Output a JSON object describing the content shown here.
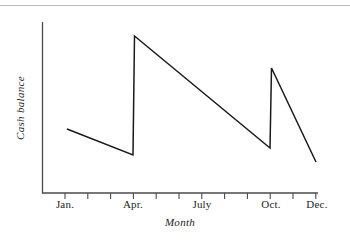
{
  "page": {
    "background_color": "#ffffff",
    "rule_color": "#b9b9b9"
  },
  "chart_data": {
    "type": "line",
    "title": "",
    "subtitle": "",
    "xlabel": "Month",
    "ylabel": "Cash balance",
    "grid": false,
    "legend": "none",
    "line_color": "#1a1a1a",
    "axis_color": "#4a4a4a",
    "xlim": [
      0,
      12
    ],
    "ylim": [
      0,
      10
    ],
    "x_tick_labels": [
      "Jan.",
      "",
      "",
      "Apr.",
      "",
      "",
      "July",
      "",
      "",
      "Oct.",
      "",
      "Dec."
    ],
    "x_tick_count": 12,
    "labelled_ticks": [
      {
        "index": 0,
        "label": "Jan."
      },
      {
        "index": 3,
        "label": "Apr."
      },
      {
        "index": 6,
        "label": "July"
      },
      {
        "index": 9,
        "label": "Oct."
      },
      {
        "index": 11,
        "label": "Dec."
      }
    ],
    "y_tick_labels": [],
    "annotations": [],
    "series": [
      {
        "name": "Cash balance",
        "points": [
          {
            "x": 0.1,
            "y": 3.8
          },
          {
            "x": 2.95,
            "y": 2.25
          },
          {
            "x": 3.0,
            "y": 9.2
          },
          {
            "x": 8.9,
            "y": 2.65
          },
          {
            "x": 9.0,
            "y": 7.35
          },
          {
            "x": 11.0,
            "y": 1.85
          }
        ]
      }
    ],
    "pixel_geometry": {
      "plot_left": 42,
      "plot_right": 318,
      "plot_top": 22,
      "plot_bottom": 193,
      "tick_start_x": 65,
      "tick_spacing": 22.8,
      "tick_length": 6,
      "polyline": "67,129 133,155 134.5,36 270,148 271.5,68 316,162"
    }
  },
  "labels": {
    "jan": "Jan.",
    "apr": "Apr.",
    "july": "July",
    "oct": "Oct.",
    "dec": "Dec.",
    "x_axis_title": "Month",
    "y_axis_title": "Cash balance"
  }
}
